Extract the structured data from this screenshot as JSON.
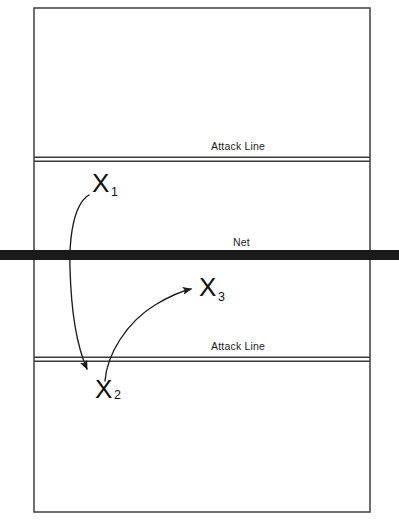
{
  "diagram": {
    "background_color": "#ffffff",
    "line_color": "#444444",
    "net_color": "#1a1a1a",
    "marker_color": "#111111",
    "court": {
      "x": 34,
      "y": 8,
      "width": 336,
      "height": 504
    },
    "labels": {
      "attack_line_top": "Attack Line",
      "attack_line_bottom": "Attack Line",
      "net": "Net"
    },
    "lines": [
      {
        "name": "attack-line-top",
        "type": "double",
        "y": 159
      },
      {
        "name": "net",
        "type": "thick-bar",
        "y": 255
      },
      {
        "name": "attack-line-bottom",
        "type": "double",
        "y": 359
      }
    ],
    "players": [
      {
        "id": "x1",
        "symbol": "X",
        "subscript": "1",
        "x": 102,
        "y": 184
      },
      {
        "id": "x2",
        "symbol": "X",
        "subscript": "2",
        "x": 106,
        "y": 390
      },
      {
        "id": "x3",
        "symbol": "X",
        "subscript": "3",
        "x": 210,
        "y": 288
      }
    ],
    "arrows": [
      {
        "id": "arrow-x1-to-x2",
        "from": "x1",
        "to": "x2",
        "description": "curved movement path from X1 down across the net to X2"
      },
      {
        "id": "arrow-x2-to-x3",
        "from": "x2",
        "to": "x3",
        "description": "curved movement path from X2 up and right to X3"
      }
    ]
  }
}
